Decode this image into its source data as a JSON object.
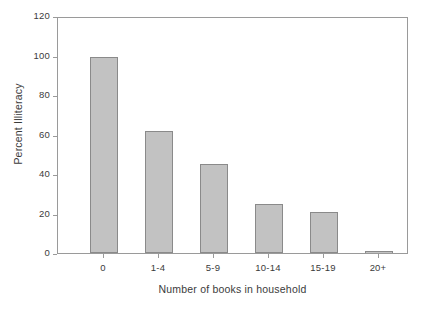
{
  "chart_data": {
    "type": "bar",
    "title": "",
    "xlabel": "Number of books in household",
    "ylabel": "Percent Illiteracy",
    "categories": [
      "0",
      "1-4",
      "5-9",
      "10-14",
      "15-19",
      "20+"
    ],
    "values": [
      100,
      62.5,
      45.5,
      25,
      21,
      1
    ],
    "ylim": [
      0,
      120
    ],
    "ytick_labels": [
      "0",
      "20",
      "40",
      "60",
      "80",
      "100",
      "120"
    ],
    "ytick_values": [
      0,
      20,
      40,
      60,
      80,
      100,
      120
    ],
    "grid": false,
    "legend": "none",
    "series": [
      {
        "name": "Percent Illiteracy",
        "values": [
          100,
          62.5,
          45.5,
          25,
          21,
          1
        ]
      }
    ]
  },
  "style": {
    "bar_fill": "#c2c2c2",
    "bar_border": "#8a8a8a",
    "axis_color": "#9a9a9a",
    "text_color": "#3b3b3b",
    "background": "#ffffff"
  }
}
